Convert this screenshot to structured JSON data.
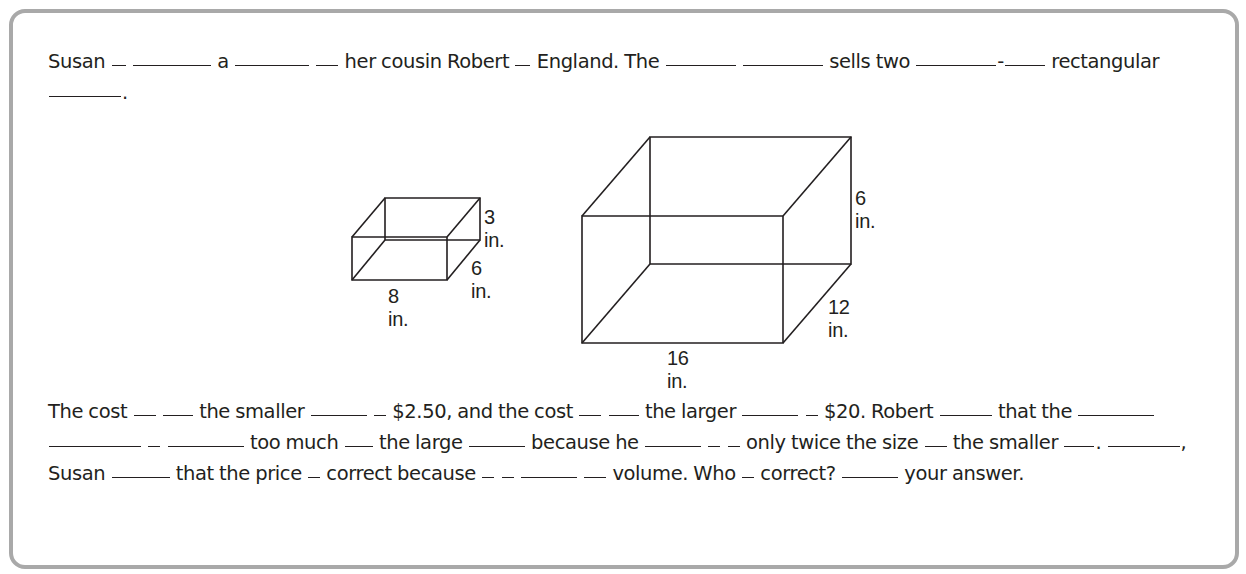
{
  "paragraph1": {
    "segments": [
      {
        "t": "Susan "
      },
      {
        "b": 14
      },
      {
        "t": " "
      },
      {
        "b": 78
      },
      {
        "t": " a "
      },
      {
        "b": 74
      },
      {
        "t": " "
      },
      {
        "b": 22
      },
      {
        "t": " her cousin Robert "
      },
      {
        "b": 15
      },
      {
        "t": " England. The "
      },
      {
        "b": 70
      },
      {
        "t": " "
      },
      {
        "b": 80
      },
      {
        "t": " sells two "
      },
      {
        "b": 80
      },
      {
        "t": "-"
      },
      {
        "b": 40
      },
      {
        "t": " rectangular "
      },
      {
        "b": 72
      },
      {
        "t": "."
      }
    ]
  },
  "figures": {
    "small_box": {
      "length": "8 in.",
      "width": "6 in.",
      "height": "3 in."
    },
    "large_box": {
      "length": "16 in.",
      "width": "12 in.",
      "height": "6 in."
    }
  },
  "paragraph2": {
    "segments": [
      {
        "t": "The cost "
      },
      {
        "b": 22
      },
      {
        "t": " "
      },
      {
        "b": 30
      },
      {
        "t": " the smaller "
      },
      {
        "b": 56
      },
      {
        "t": " "
      },
      {
        "b": 12
      },
      {
        "t": " $2.50, and the cost "
      },
      {
        "b": 22
      },
      {
        "t": " "
      },
      {
        "b": 30
      },
      {
        "t": " the larger "
      },
      {
        "b": 56
      },
      {
        "t": " "
      },
      {
        "b": 12
      },
      {
        "t": " $20. Robert "
      },
      {
        "b": 52
      },
      {
        "t": " that the "
      },
      {
        "b": 76
      },
      {
        "t": " "
      },
      {
        "b": 92
      },
      {
        "t": " "
      },
      {
        "b": 12
      },
      {
        "t": " "
      },
      {
        "b": 76
      },
      {
        "t": " too much "
      },
      {
        "b": 28
      },
      {
        "t": " the large "
      },
      {
        "b": 56
      },
      {
        "t": " because he "
      },
      {
        "b": 56
      },
      {
        "t": " "
      },
      {
        "b": 12
      },
      {
        "t": " "
      },
      {
        "b": 12
      },
      {
        "t": " only twice the size "
      },
      {
        "b": 22
      },
      {
        "t": " the smaller "
      },
      {
        "b": 30
      },
      {
        "t": ". "
      },
      {
        "b": 72
      },
      {
        "t": ", Susan "
      },
      {
        "b": 58
      },
      {
        "t": " that the price "
      },
      {
        "b": 12
      },
      {
        "t": " correct because "
      },
      {
        "b": 12
      },
      {
        "t": " "
      },
      {
        "b": 12
      },
      {
        "t": " "
      },
      {
        "b": 56
      },
      {
        "t": " "
      },
      {
        "b": 22
      },
      {
        "t": " volume. Who "
      },
      {
        "b": 12
      },
      {
        "t": " correct? "
      },
      {
        "b": 56
      },
      {
        "t": " your answer."
      }
    ]
  }
}
